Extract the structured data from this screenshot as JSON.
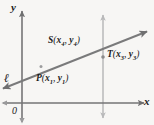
{
  "figure": {
    "type": "coordinate-geometry-diagram",
    "background_color": "#f7f6f4",
    "stroke_color": "#6f6f70",
    "light_stroke_color": "#b9b9ba",
    "text_color": "#1c1c1c",
    "width": 154,
    "height": 125
  },
  "axes": {
    "y_axis_label": "y",
    "x_axis_label": "x",
    "origin_label": "0",
    "x_axis_y": 103,
    "y_axis_x": 22,
    "x_range_px": [
      2,
      146
    ],
    "y_range_px": [
      10,
      122
    ]
  },
  "line": {
    "label": "ℓ",
    "name": "line-ell",
    "start_px": [
      2,
      89
    ],
    "end_px": [
      148,
      31
    ],
    "double_arrow": true
  },
  "vertical_line": {
    "name": "vertical-reference-line",
    "x_px": 103,
    "top_px": 14,
    "bottom_px": 119,
    "double_arrow": true
  },
  "points": [
    {
      "key": "S",
      "name": "point-S",
      "letter": "S",
      "x_label": "x",
      "x_sub": "4",
      "y_label": "y",
      "y_sub": "4",
      "full": "S(x4, y4)",
      "marker_px": [
        62,
        66
      ],
      "show_marker": false
    },
    {
      "key": "T",
      "name": "point-T",
      "letter": "T",
      "x_label": "x",
      "x_sub": "3",
      "y_label": "y",
      "y_sub": "3",
      "full": "T(x3, y3)",
      "marker_px": [
        103,
        57
      ],
      "show_marker": true
    },
    {
      "key": "P",
      "name": "point-P",
      "letter": "P",
      "x_label": "x",
      "x_sub": "1",
      "y_label": "y",
      "y_sub": "1",
      "full": "P(x1, y1)",
      "marker_px": [
        41,
        66
      ],
      "show_marker": true
    }
  ],
  "punctuation": {
    "open_paren": "(",
    "close_paren": ")",
    "comma": ","
  }
}
